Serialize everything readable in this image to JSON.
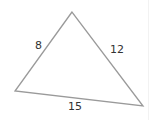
{
  "diagram": {
    "type": "triangle",
    "stroke_color": "#9a9a9a",
    "vertices": {
      "top": [
        72,
        12
      ],
      "bottom_left": [
        15,
        91
      ],
      "bottom_right": [
        143,
        106
      ]
    },
    "sides": {
      "left": "8",
      "right": "12",
      "bottom": "15"
    }
  }
}
